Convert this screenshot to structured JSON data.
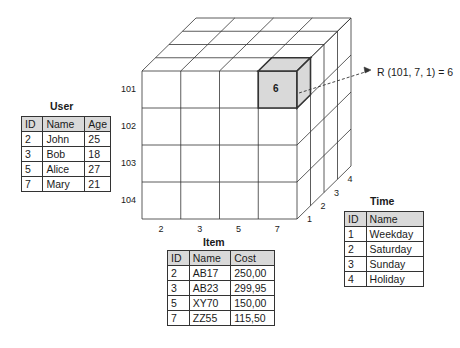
{
  "user_table": {
    "title": "User",
    "columns": [
      "ID",
      "Name",
      "Age"
    ],
    "rows": [
      [
        "2",
        "John",
        "25"
      ],
      [
        "3",
        "Bob",
        "18"
      ],
      [
        "5",
        "Alice",
        "27"
      ],
      [
        "7",
        "Mary",
        "21"
      ]
    ]
  },
  "item_table": {
    "title": "Item",
    "columns": [
      "ID",
      "Name",
      "Cost"
    ],
    "rows": [
      [
        "2",
        "AB17",
        "250,00"
      ],
      [
        "3",
        "AB23",
        "299,95"
      ],
      [
        "5",
        "XY70",
        "150,00"
      ],
      [
        "7",
        "ZZ55",
        "115,50"
      ]
    ]
  },
  "time_table": {
    "title": "Time",
    "columns": [
      "ID",
      "Name"
    ],
    "rows": [
      [
        "1",
        "Weekday"
      ],
      [
        "2",
        "Saturday"
      ],
      [
        "3",
        "Sunday"
      ],
      [
        "4",
        "Holiday"
      ]
    ]
  },
  "cube": {
    "row_labels": [
      "101",
      "102",
      "103",
      "104"
    ],
    "col_labels": [
      "2",
      "3",
      "5",
      "7"
    ],
    "depth_labels": [
      "1",
      "2",
      "3",
      "4"
    ],
    "highlight": {
      "row": 0,
      "col": 3,
      "depth": 0,
      "value": "6",
      "fill": "#d9d9d9"
    },
    "formula": "R (101, 7, 1) = 6"
  },
  "colors": {
    "line": "#333333",
    "header_fill": "#d9d9d9",
    "highlight_fill": "#d9d9d9"
  }
}
